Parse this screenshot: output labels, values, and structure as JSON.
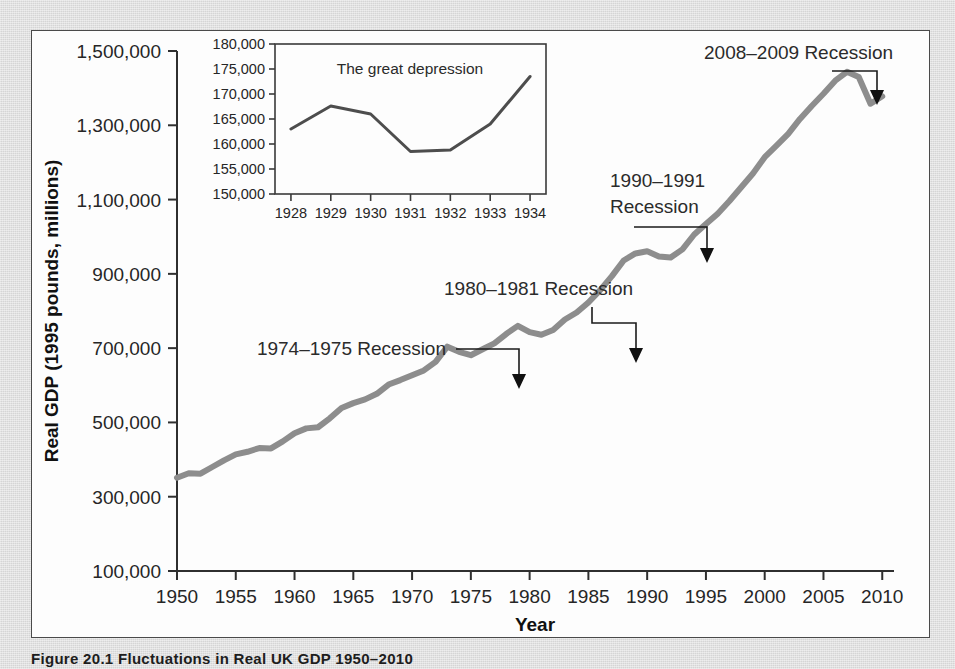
{
  "figure": {
    "caption": "Figure 20.1   Fluctuations in Real UK GDP 1950–2010",
    "panel_background": "#fdfdfd",
    "page_background": "#dcdcdc",
    "border_color": "#4a4a4a"
  },
  "chart_data": {
    "type": "line",
    "title": "",
    "xlabel": "Year",
    "ylabel": "Real GDP (1995 pounds, millions)",
    "xlim": [
      1950,
      2011
    ],
    "ylim": [
      100000,
      1500000
    ],
    "grid": false,
    "legend": "none",
    "line_color": "#8d8d8d",
    "xticks": [
      1950,
      1955,
      1960,
      1965,
      1970,
      1975,
      1980,
      1985,
      1990,
      1995,
      2000,
      2005,
      2010
    ],
    "xtick_labels": [
      "1950",
      "1955",
      "1960",
      "1965",
      "1970",
      "1975",
      "1980",
      "1985",
      "1990",
      "1995",
      "2000",
      "2005",
      "2010"
    ],
    "yticks": [
      100000,
      300000,
      500000,
      700000,
      900000,
      1100000,
      1300000,
      1500000
    ],
    "ytick_labels": [
      "100,000",
      "300,000",
      "500,000",
      "700,000",
      "900,000",
      "1,100,000",
      "1,300,000",
      "1,500,000"
    ],
    "x": [
      1950,
      1951,
      1952,
      1953,
      1954,
      1955,
      1956,
      1957,
      1958,
      1959,
      1960,
      1961,
      1962,
      1963,
      1964,
      1965,
      1966,
      1967,
      1968,
      1969,
      1970,
      1971,
      1972,
      1973,
      1974,
      1975,
      1976,
      1977,
      1978,
      1979,
      1980,
      1981,
      1982,
      1983,
      1984,
      1985,
      1986,
      1987,
      1988,
      1989,
      1990,
      1991,
      1992,
      1993,
      1994,
      1995,
      1996,
      1997,
      1998,
      1999,
      2000,
      2001,
      2002,
      2003,
      2004,
      2005,
      2006,
      2007,
      2008,
      2009,
      2010
    ],
    "y": [
      351000,
      363000,
      362000,
      380000,
      398000,
      414000,
      421000,
      431000,
      430000,
      449000,
      471000,
      484000,
      487000,
      511000,
      539000,
      552000,
      562000,
      577000,
      602000,
      614000,
      627000,
      640000,
      663000,
      704000,
      690000,
      681000,
      697000,
      713000,
      738000,
      760000,
      743000,
      736000,
      749000,
      777000,
      796000,
      823000,
      856000,
      894000,
      936000,
      955000,
      961000,
      947000,
      944000,
      966000,
      1006000,
      1034000,
      1062000,
      1096000,
      1133000,
      1170000,
      1214000,
      1245000,
      1277000,
      1317000,
      1352000,
      1385000,
      1420000,
      1444000,
      1430000,
      1358000,
      1378000
    ],
    "annotations": [
      {
        "text": "1974–1975 Recession",
        "target_year": 1975,
        "target_value": 681000
      },
      {
        "text": "1980–1981 Recession",
        "target_year": 1982,
        "target_value": 749000
      },
      {
        "text": "1990–1991\nRecession",
        "target_year": 1992,
        "target_value": 944000
      },
      {
        "text": "2008–2009 Recession",
        "target_year": 2009,
        "target_value": 1358000
      }
    ],
    "annotation_lines": {
      "1974_1975": "1974–1975 Recession",
      "1980_1981": "1980–1981 Recession",
      "1990_1991_l1": "1990–1991",
      "1990_1991_l2": "Recession",
      "2008_2009": "2008–2009 Recession"
    }
  },
  "inset_chart_data": {
    "type": "line",
    "title": "The great depression",
    "xlabel": "",
    "ylabel": "",
    "xlim": [
      1927.6,
      1934.4
    ],
    "ylim": [
      150000,
      180000
    ],
    "grid": false,
    "legend": "none",
    "line_color": "#4d4d4d",
    "xticks": [
      1928,
      1929,
      1930,
      1931,
      1932,
      1933,
      1934
    ],
    "xtick_labels": [
      "1928",
      "1929",
      "1930",
      "1931",
      "1932",
      "1933",
      "1934"
    ],
    "yticks": [
      150000,
      155000,
      160000,
      165000,
      170000,
      175000,
      180000
    ],
    "ytick_labels": [
      "150,000",
      "155,000",
      "160,000",
      "165,000",
      "170,000",
      "175,000",
      "180,000"
    ],
    "x": [
      1928,
      1929,
      1930,
      1931,
      1932,
      1933,
      1934
    ],
    "y": [
      163000,
      167600,
      166000,
      158500,
      158800,
      164000,
      173500
    ]
  },
  "page_ghost_text": {
    "line1": "Measuring and changing your view of the world",
    "line2": "Fluctuations in the structure of your economy",
    "line3": "Understanding the broader picture",
    "line4": "and changing your overall and established",
    "line5": "Exercise the fluctuations in changing environment",
    "line6": "the national economy"
  }
}
